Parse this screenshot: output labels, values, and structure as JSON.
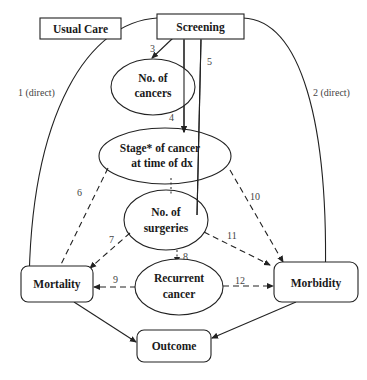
{
  "diagram": {
    "nodes": {
      "usual_care": "Usual Care",
      "screening": "Screening",
      "no_cancers_1": "No. of",
      "no_cancers_2": "cancers",
      "stage_1": "Stage* of cancer",
      "stage_2": "at time of dx",
      "surgeries_1": "No. of",
      "surgeries_2": "surgeries",
      "mortality": "Mortality",
      "recurrent_1": "Recurrent",
      "recurrent_2": "cancer",
      "morbidity": "Morbidity",
      "outcome": "Outcome"
    },
    "edges": {
      "e1": "1 (direct)",
      "e2": "2 (direct)",
      "e3": "3",
      "e4": "4",
      "e5": "5",
      "e6": "6",
      "e7": "7",
      "e8": "8",
      "e9": "9",
      "e10": "10",
      "e11": "11",
      "e12": "12"
    }
  }
}
